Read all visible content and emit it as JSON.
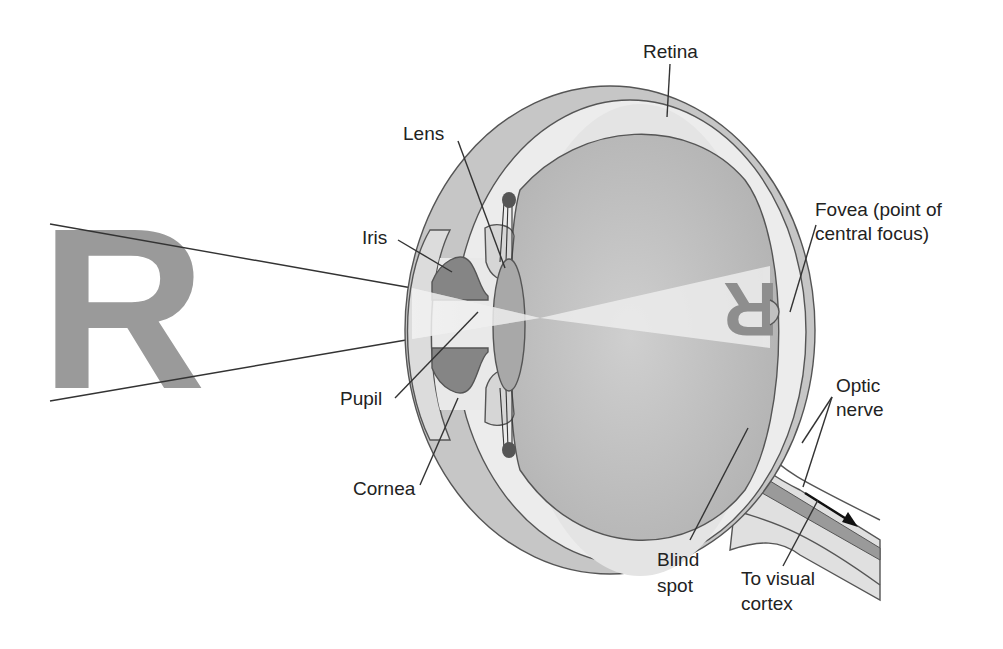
{
  "labels": {
    "retina": "Retina",
    "lens": "Lens",
    "iris": "Iris",
    "fovea_line1": "Fovea (point of",
    "fovea_line2": "central focus)",
    "pupil": "Pupil",
    "cornea": "Cornea",
    "optic_nerve_line1": "Optic",
    "optic_nerve_line2": "nerve",
    "blind_spot_line1": "Blind",
    "blind_spot_line2": "spot",
    "visual_cortex_line1": "To visual",
    "visual_cortex_line2": "cortex"
  },
  "object_letter": "R",
  "image_letter": "R",
  "colors": {
    "sclera_outer": "#c4c4c4",
    "choroid_band": "#e8e8e8",
    "vitreous": "#bdbdbd",
    "iris": "#8a8a8a",
    "lens": "#a8a8a8",
    "letter": "#999999",
    "light_beam": "#e9e9e9",
    "nerve_core": "#9a9a9a",
    "arrow": "#111111"
  }
}
